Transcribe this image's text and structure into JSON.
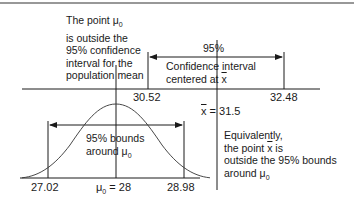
{
  "diagram": {
    "type": "hypothesis-test-confidence-interval-illustration",
    "annotations": {
      "left_note": [
        "The point μ₀",
        "is outside the",
        "95% confidence",
        "interval for the",
        "population mean"
      ],
      "right_note": [
        "Equivalently,",
        "the point x̄ is",
        "outside the 95% bounds",
        "around μ₀"
      ],
      "upper_interval_label": "95%",
      "upper_interval_desc": [
        "Confidence interval",
        "centered at x̄"
      ],
      "lower_interval_desc": [
        "95% bounds",
        "around μ₀"
      ]
    },
    "upper_axis": {
      "ticks": [
        {
          "label": "30.52",
          "value": 30.52
        },
        {
          "label": "32.48",
          "value": 32.48
        }
      ],
      "center_label": "x̄ = 31.5",
      "center_value": 31.5
    },
    "lower_axis": {
      "ticks": [
        {
          "label": "27.02",
          "value": 27.02
        },
        {
          "label": "28.98",
          "value": 28.98
        }
      ],
      "center_label": "μ₀ = 28",
      "center_value": 28
    },
    "colors": {
      "line": "#1a1a1a",
      "background": "#ffffff"
    }
  },
  "text": {
    "left1": "The point μ",
    "left1_sub": "0",
    "left2": "is outside the",
    "left3": "95% confidence",
    "left4": "interval for the",
    "left5": "population mean",
    "pct95": "95%",
    "ci1": "Confidence interval",
    "ci2": "centered at ",
    "xbar": "x",
    "t3052": "30.52",
    "t3248": "32.48",
    "xbar_eq": " = 31.5",
    "eq1": "Equivalently,",
    "eq2a": "the point ",
    "eq2b": " is",
    "eq3": "outside the 95% bounds",
    "eq4": "around μ",
    "eq4_sub": "0",
    "b1": "95% bounds",
    "b2": "around μ",
    "b2_sub": "0",
    "t2702": "27.02",
    "mu_eq": "μ",
    "mu_eq_sub": "0",
    "mu_eq_val": " = 28",
    "t2898": "28.98"
  }
}
